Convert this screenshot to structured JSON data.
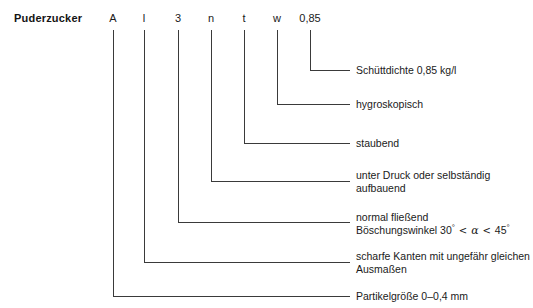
{
  "diagram": {
    "title": "Puderzucker",
    "line_color": "#3a3a3a",
    "text_color": "#1a1a1a",
    "code_characters": [
      {
        "label": "A",
        "x": 113
      },
      {
        "label": "l",
        "x": 144
      },
      {
        "label": "3",
        "x": 178
      },
      {
        "label": "n",
        "x": 211
      },
      {
        "label": "t",
        "x": 244
      },
      {
        "label": "w",
        "x": 277
      },
      {
        "label": "0,85",
        "x": 310
      }
    ],
    "descriptions": [
      {
        "key": "schuettdichte",
        "line1": "Schüttdichte 0,85 kg/l",
        "line2": "",
        "y": 64
      },
      {
        "key": "hygroskopisch",
        "line1": "hygroskopisch",
        "line2": "",
        "y": 98
      },
      {
        "key": "staubend",
        "line1": "staubend",
        "line2": "",
        "y": 137
      },
      {
        "key": "unter-druck",
        "line1": "unter Druck oder selbständig",
        "line2": "aufbauend",
        "y": 169
      },
      {
        "key": "normal-fliessend",
        "line1": "normal fließend",
        "line2": "",
        "y": 211
      },
      {
        "key": "scharfe-kanten",
        "line1": "scharfe Kanten mit ungefähr gleichen",
        "line2": "Ausmaßen",
        "y": 250
      },
      {
        "key": "partikelgroesse",
        "line1": "Partikelgröße 0–0,4 mm",
        "line2": "",
        "y": 290
      }
    ],
    "boeschungswinkel": {
      "prefix": "Böschungswinkel 30",
      "deg1": "°",
      "rel1": "<",
      "alpha": "α",
      "rel2": "<",
      "value2": "45",
      "deg2": "°"
    }
  }
}
